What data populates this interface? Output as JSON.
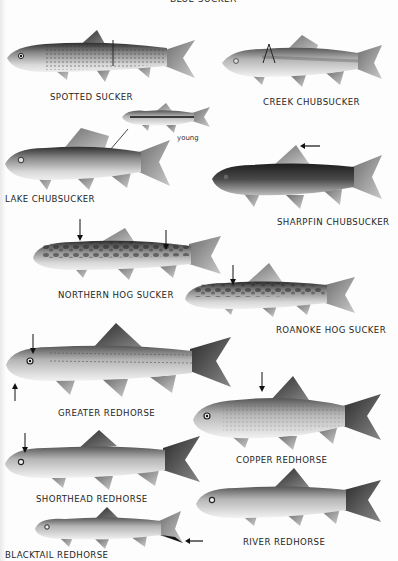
{
  "plate": {
    "top_caption": "BLUE SUCKER",
    "colors": {
      "background": "#fdfdfd",
      "ink": "#262626",
      "fish_dark": "#3a3a3a",
      "fish_mid": "#8c8c8c",
      "fish_light": "#dcdcdc"
    }
  },
  "species": [
    {
      "id": "spotted-sucker",
      "label": "SPOTTED SUCKER",
      "markers": 1
    },
    {
      "id": "creek-chubsucker",
      "label": "CREEK CHUBSUCKER",
      "markers": 1
    },
    {
      "id": "lake-chubsucker",
      "label": "LAKE CHUBSUCKER",
      "inset_label": "young"
    },
    {
      "id": "sharpfin-chubsucker",
      "label": "SHARPFIN CHUBSUCKER",
      "markers": 1
    },
    {
      "id": "northern-hog-sucker",
      "label": "NORTHERN HOG SUCKER",
      "markers": 2
    },
    {
      "id": "roanoke-hog-sucker",
      "label": "ROANOKE HOG SUCKER",
      "markers": 1
    },
    {
      "id": "greater-redhorse",
      "label": "GREATER REDHORSE",
      "markers": 2
    },
    {
      "id": "copper-redhorse",
      "label": "COPPER REDHORSE",
      "markers": 1
    },
    {
      "id": "shorthead-redhorse",
      "label": "SHORTHEAD REDHORSE",
      "markers": 1
    },
    {
      "id": "river-redhorse",
      "label": "RIVER REDHORSE",
      "markers": 0
    },
    {
      "id": "blacktail-redhorse",
      "label": "BLACKTAIL REDHORSE",
      "markers": 1
    }
  ]
}
